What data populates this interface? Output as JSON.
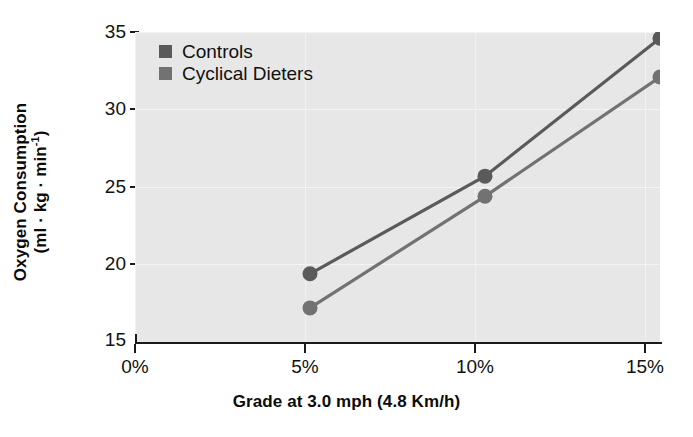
{
  "chart_data": {
    "type": "line",
    "title": "",
    "subtitle": "",
    "xlabel": "Grade at 3.0 mph (4.8 Km/h)",
    "ylabel_line1": "Oxygen Consumption",
    "ylabel_line2_pre": "(ml · kg · min",
    "ylabel_line2_sup": "-1",
    "ylabel_line2_post": ")",
    "ylabel": "Oxygen Consumption (ml · kg · min-1)",
    "categories": [
      "0%",
      "5%",
      "10%",
      "15%"
    ],
    "x": [
      0,
      5,
      10,
      15
    ],
    "xtick_labels": [
      "0%",
      "5%",
      "10%",
      "15%"
    ],
    "ytick_labels": [
      "15",
      "20",
      "25",
      "30",
      "35"
    ],
    "yticks": [
      15,
      20,
      25,
      30,
      35
    ],
    "xlim": [
      0,
      15
    ],
    "ylim": [
      15,
      35
    ],
    "grid": true,
    "legend_position": "top-left",
    "series": [
      {
        "name": "Controls",
        "color": "#5a5a5a",
        "x": [
          5,
          10,
          15
        ],
        "values": [
          19.4,
          25.7,
          34.6
        ]
      },
      {
        "name": "Cyclical Dieters",
        "color": "#727272",
        "x": [
          5,
          10,
          15
        ],
        "values": [
          17.2,
          24.4,
          32.1
        ]
      }
    ],
    "plot_background": "#e7e7e7",
    "axis_color": "#1a1a1a",
    "marker": "circle",
    "marker_size": 15
  },
  "legend": {
    "items": [
      {
        "label": "Controls",
        "color": "#5a5a5a"
      },
      {
        "label": "Cyclical Dieters",
        "color": "#727272"
      }
    ]
  }
}
